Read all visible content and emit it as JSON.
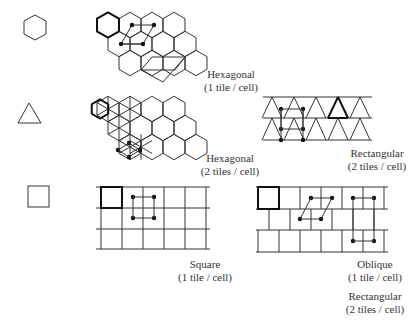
{
  "rows": [
    {
      "shape": "hexagon-icon",
      "panels": [
        {
          "name": "hexagonal-1",
          "title": "Hexagonal",
          "subtitle": "(1 tile / cell)"
        }
      ]
    },
    {
      "shape": "triangle-icon",
      "panels": [
        {
          "name": "hexagonal-2",
          "title": "Hexagonal",
          "subtitle": "(2 tiles / cell)"
        },
        {
          "name": "rectangular-tri",
          "title": "Rectangular",
          "subtitle": "(2 tiles / cell)"
        }
      ]
    },
    {
      "shape": "square-icon",
      "panels": [
        {
          "name": "square",
          "title": "Square",
          "subtitle": "(1 tile / cell)"
        },
        {
          "name": "oblique",
          "title": "Oblique",
          "subtitle": "(1 tile / cell)"
        },
        {
          "name": "rectangular-brick",
          "title": "Rectangular",
          "subtitle": "(2 tiles / cell)"
        }
      ]
    }
  ],
  "colors": {
    "line": "#333333",
    "background": "#ffffff"
  }
}
